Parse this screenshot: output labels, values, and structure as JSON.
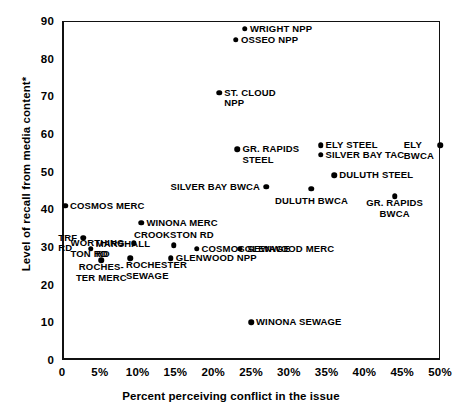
{
  "chart_data": {
    "type": "scatter",
    "title": "",
    "xlabel": "Percent perceiving conflict in the issue",
    "ylabel": "Level of recall from media content*",
    "xlim": [
      0,
      50
    ],
    "ylim": [
      0,
      90
    ],
    "grid": false,
    "legend": "none",
    "xticks": [
      "0",
      "5%",
      "10%",
      "15%",
      "20%",
      "25%",
      "30%",
      "35%",
      "40%",
      "45%",
      "50%"
    ],
    "xtick_values": [
      0,
      5,
      10,
      15,
      20,
      25,
      30,
      35,
      40,
      45,
      50
    ],
    "yticks": [
      "0",
      "10",
      "20",
      "30",
      "40",
      "50",
      "60",
      "70",
      "80",
      "90"
    ],
    "ytick_values": [
      0,
      10,
      20,
      30,
      40,
      50,
      60,
      70,
      80,
      90
    ],
    "points": [
      {
        "label": "WRIGHT NPP",
        "x": 24.2,
        "y": 88.0,
        "pos": "right"
      },
      {
        "label": "OSSEO NPP",
        "x": 23.0,
        "y": 85.0,
        "pos": "right"
      },
      {
        "label": "ST. CLOUD\nNPP",
        "x": 20.8,
        "y": 71.0,
        "pos": "right-top"
      },
      {
        "label": "ELY\nBWCA",
        "x": 50.0,
        "y": 57.0,
        "pos": "left-top"
      },
      {
        "label": "ELY STEEL",
        "x": 34.2,
        "y": 57.0,
        "pos": "right"
      },
      {
        "label": "GR. RAPIDS\nSTEEL",
        "x": 23.2,
        "y": 56.0,
        "pos": "right-top"
      },
      {
        "label": "SILVER BAY TAC",
        "x": 34.2,
        "y": 54.5,
        "pos": "right"
      },
      {
        "label": "DULUTH STEEL",
        "x": 36.0,
        "y": 49.0,
        "pos": "right"
      },
      {
        "label": "SILVER BAY BWCA",
        "x": 27.0,
        "y": 46.0,
        "pos": "left"
      },
      {
        "label": "DULUTH BWCA",
        "x": 33.0,
        "y": 45.5,
        "pos": "below"
      },
      {
        "label": "GR. RAPIDS\nBWCA",
        "x": 44.0,
        "y": 43.5,
        "pos": "below"
      },
      {
        "label": "COSMOS MERC",
        "x": 0.4,
        "y": 41.0,
        "pos": "right"
      },
      {
        "label": "WINONA MERC",
        "x": 10.5,
        "y": 36.5,
        "pos": "right"
      },
      {
        "label": "TRF\nRD",
        "x": 2.8,
        "y": 32.5,
        "pos": "left-top"
      },
      {
        "label": "WORTHING-\nTON RD",
        "x": 9.5,
        "y": 31.0,
        "pos": "left-top"
      },
      {
        "label": "CROOKSTON RD",
        "x": 14.8,
        "y": 30.5,
        "pos": "above"
      },
      {
        "label": "COSMOS SEWAGE",
        "x": 17.8,
        "y": 29.5,
        "pos": "right"
      },
      {
        "label": "MARSHALL\nRD",
        "x": 3.8,
        "y": 29.5,
        "pos": "right"
      },
      {
        "label": "GLENWOOD MERC",
        "x": 23.5,
        "y": 29.5,
        "pos": "right"
      },
      {
        "label": "GLENWOOD NPP",
        "x": 14.4,
        "y": 27.0,
        "pos": "right"
      },
      {
        "label": "ROCHES-\nTER MERC",
        "x": 5.2,
        "y": 26.5,
        "pos": "below"
      },
      {
        "label": "ROCHESTER\nSEWAGE",
        "x": 9.0,
        "y": 27.0,
        "pos": "below-right"
      },
      {
        "label": "WINONA SEWAGE",
        "x": 25.0,
        "y": 10.0,
        "pos": "right"
      }
    ]
  },
  "footnote": "*"
}
